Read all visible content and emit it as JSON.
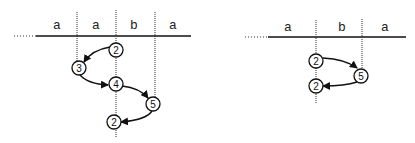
{
  "left_diagram": {
    "cells": [
      "a",
      "a",
      "b",
      "a"
    ],
    "states": [
      "2",
      "3",
      "4",
      "5",
      "2"
    ]
  },
  "right_diagram": {
    "cells": [
      "a",
      "b",
      "a"
    ],
    "states": [
      "2",
      "5",
      "2"
    ]
  },
  "colors": {
    "ink": "#111111",
    "background": "#ffffff"
  }
}
